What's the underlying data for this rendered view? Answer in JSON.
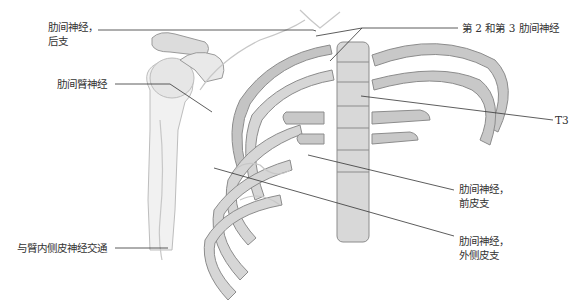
{
  "figure": {
    "colors": {
      "bone_fill": "#d9d9d9",
      "bone_light": "#ececec",
      "bone_stroke": "#8c8c8c",
      "rib_dark": "#a9a9a9",
      "nerve": "#c7c7c7",
      "leader_line": "#333333",
      "text": "#333333"
    }
  },
  "labels": {
    "posterior_branch": {
      "line1": "肋间神经，",
      "line2": "后支"
    },
    "intercostobrachial": {
      "text": "肋间臂神经"
    },
    "medial_cutaneous_communication": {
      "text": "与臂内侧皮神经交通"
    },
    "second_third_intercostal": {
      "text": "第 2 和第 3 肋间神经"
    },
    "t3": {
      "text": "T3"
    },
    "anterior_cutaneous": {
      "line1": "肋间神经，",
      "line2": "前皮支"
    },
    "lateral_cutaneous": {
      "line1": "肋间神经，",
      "line2": "外侧皮支"
    }
  }
}
